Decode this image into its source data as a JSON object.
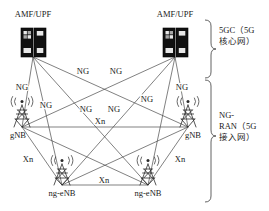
{
  "diagram": {
    "nodes": [
      {
        "id": "amf-left",
        "label": "AMF/UPF",
        "icon": "server-rack-icon",
        "x": 33,
        "y": 57,
        "label_x": 33,
        "label_y": 17
      },
      {
        "id": "amf-right",
        "label": "AMF/UPF",
        "icon": "server-rack-icon",
        "x": 175,
        "y": 57,
        "label_x": 175,
        "label_y": 17
      },
      {
        "id": "gnb-left",
        "label": "gNB",
        "icon": "cell-tower-icon",
        "x": 22,
        "y": 127,
        "label_x": 18,
        "label_y": 138
      },
      {
        "id": "gnb-right",
        "label": "gNB",
        "icon": "cell-tower-icon",
        "x": 188,
        "y": 127,
        "label_x": 192,
        "label_y": 138
      },
      {
        "id": "ngenb-left",
        "label": "ng-eNB",
        "icon": "cell-tower-icon",
        "x": 62,
        "y": 185,
        "label_x": 62,
        "label_y": 196
      },
      {
        "id": "ngenb-right",
        "label": "ng-eNB",
        "icon": "cell-tower-icon",
        "x": 148,
        "y": 185,
        "label_x": 148,
        "label_y": 196
      }
    ],
    "edge_labels": [
      {
        "id": "ng-1",
        "text": "NG",
        "x": 22,
        "y": 90
      },
      {
        "id": "ng-2",
        "text": "NG",
        "x": 83,
        "y": 74
      },
      {
        "id": "ng-3",
        "text": "NG",
        "x": 116,
        "y": 74
      },
      {
        "id": "ng-4",
        "text": "NG",
        "x": 182,
        "y": 90
      },
      {
        "id": "ng-5",
        "text": "NG",
        "x": 46,
        "y": 108
      },
      {
        "id": "ng-6",
        "text": "NG",
        "x": 147,
        "y": 102
      },
      {
        "id": "ng-7",
        "text": "NG",
        "x": 86,
        "y": 112
      },
      {
        "id": "ng-8",
        "text": "NG",
        "x": 114,
        "y": 112
      },
      {
        "id": "xn-1",
        "text": "Xn",
        "x": 100,
        "y": 124
      },
      {
        "id": "xn-2",
        "text": "Xn",
        "x": 28,
        "y": 162
      },
      {
        "id": "xn-3",
        "text": "Xn",
        "x": 104,
        "y": 183
      },
      {
        "id": "xn-4",
        "text": "Xn",
        "x": 180,
        "y": 162
      }
    ],
    "edges": [
      {
        "id": "ng-amfl-gnbl",
        "type": "NG",
        "from": "amf-left",
        "to": "gnb-left"
      },
      {
        "id": "ng-amfl-gnbr",
        "type": "NG",
        "from": "amf-left",
        "to": "gnb-right"
      },
      {
        "id": "ng-amfl-ngenbl",
        "type": "NG",
        "from": "amf-left",
        "to": "ngenb-left"
      },
      {
        "id": "ng-amfl-ngenbr",
        "type": "NG",
        "from": "amf-left",
        "to": "ngenb-right"
      },
      {
        "id": "ng-amfr-gnbl",
        "type": "NG",
        "from": "amf-right",
        "to": "gnb-left"
      },
      {
        "id": "ng-amfr-gnbr",
        "type": "NG",
        "from": "amf-right",
        "to": "gnb-right"
      },
      {
        "id": "ng-amfr-ngenbl",
        "type": "NG",
        "from": "amf-right",
        "to": "ngenb-left"
      },
      {
        "id": "ng-amfr-ngenbr",
        "type": "NG",
        "from": "amf-right",
        "to": "ngenb-right"
      },
      {
        "id": "xn-gnbl-gnbr",
        "type": "Xn",
        "from": "gnb-left",
        "to": "gnb-right"
      },
      {
        "id": "xn-gnbl-ngenbl",
        "type": "Xn",
        "from": "gnb-left",
        "to": "ngenb-left"
      },
      {
        "id": "xn-gnbl-ngenbr",
        "type": "Xn",
        "from": "gnb-left",
        "to": "ngenb-right"
      },
      {
        "id": "xn-gnbr-ngenbl",
        "type": "Xn",
        "from": "gnb-right",
        "to": "ngenb-left"
      },
      {
        "id": "xn-gnbr-ngenbr",
        "type": "Xn",
        "from": "gnb-right",
        "to": "ngenb-right"
      },
      {
        "id": "xn-ngenbl-ngenbr",
        "type": "Xn",
        "from": "ngenb-left",
        "to": "ngenb-right"
      }
    ],
    "groups": [
      {
        "id": "group-5gc",
        "label": "5GC（5G\n核心网）",
        "brace_top": 20,
        "brace_bottom": 78
      },
      {
        "id": "group-ngran",
        "label": "NG-\nRAN（5G\n接入网）",
        "brace_top": 80,
        "brace_bottom": 202
      }
    ]
  },
  "colors": {
    "line": "#4a4a4a",
    "text": "#1a1a1a",
    "server": "#111111",
    "background": "#ffffff"
  }
}
